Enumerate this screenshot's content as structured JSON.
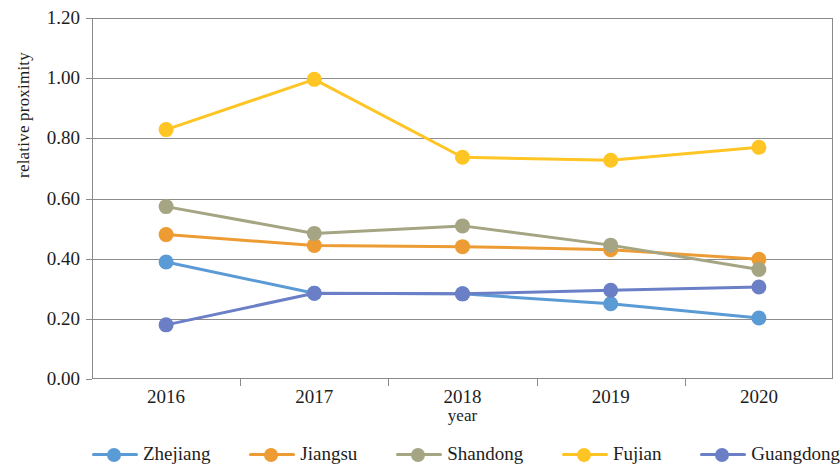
{
  "chart_data": {
    "type": "line",
    "title": "",
    "xlabel": "year",
    "ylabel": "relative proximity",
    "categories": [
      "2016",
      "2017",
      "2018",
      "2019",
      "2020"
    ],
    "ylim": [
      0.0,
      1.2
    ],
    "y_ticks": [
      "0.00",
      "0.20",
      "0.40",
      "0.60",
      "0.80",
      "1.00",
      "1.20"
    ],
    "y_tick_values": [
      0.0,
      0.2,
      0.4,
      0.6,
      0.8,
      1.0,
      1.2
    ],
    "grid": "horizontal",
    "legend_position": "bottom",
    "series": [
      {
        "name": "Zhejiang",
        "color": "#5B9BD5",
        "values": [
          0.389,
          0.285,
          0.283,
          0.25,
          0.203
        ]
      },
      {
        "name": "Jiangsu",
        "color": "#ED9B33",
        "values": [
          0.48,
          0.444,
          0.44,
          0.43,
          0.398
        ]
      },
      {
        "name": "Shandong",
        "color": "#A5A584",
        "values": [
          0.573,
          0.484,
          0.509,
          0.445,
          0.364
        ]
      },
      {
        "name": "Fujian",
        "color": "#FFC524",
        "values": [
          0.829,
          0.996,
          0.737,
          0.727,
          0.77
        ]
      },
      {
        "name": "Guangdong",
        "color": "#6B7FC7",
        "values": [
          0.18,
          0.285,
          0.283,
          0.295,
          0.306
        ]
      }
    ]
  },
  "axis": {
    "y_title": "relative proximity",
    "x_title": "year"
  },
  "legend": {
    "items": [
      {
        "label": "Zhejiang",
        "color": "#5B9BD5"
      },
      {
        "label": "Jiangsu",
        "color": "#ED9B33"
      },
      {
        "label": "Shandong",
        "color": "#A5A584"
      },
      {
        "label": "Fujian",
        "color": "#FFC524"
      },
      {
        "label": "Guangdong",
        "color": "#6B7FC7"
      }
    ]
  }
}
